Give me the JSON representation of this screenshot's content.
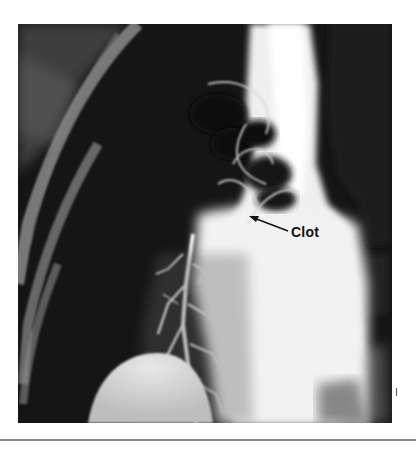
{
  "figure": {
    "kind": "pulmonary angiogram radiograph",
    "annotation": {
      "label": "Clot",
      "arrow_direction": "up-left",
      "arrow_color": "#111111"
    },
    "colors": {
      "background": "#141414",
      "contrast": "#f4f4f4",
      "page": "#ffffff",
      "rule": "#8a8a8a"
    }
  }
}
